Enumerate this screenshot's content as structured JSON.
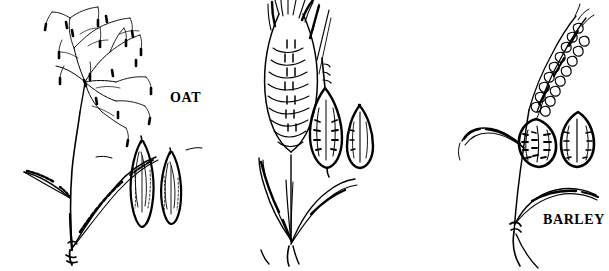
{
  "figure": {
    "width": 609,
    "height": 271,
    "background_color": "#ffffff",
    "ink_color": "#000000",
    "style": "pen-and-ink line engraving"
  },
  "panels": [
    {
      "id": "oat",
      "label": "OAT",
      "label_position": {
        "x": 170,
        "y": 91
      },
      "inflorescence_type": "open branched panicle with drooping spikelets",
      "seed_count": 2,
      "seed_shape": "long narrow lance-shaped grain with pointed tips",
      "leaf_count": 2
    },
    {
      "id": "barley",
      "label": "BARLEY",
      "label_position": {
        "x": 340,
        "y": 213
      },
      "inflorescence_type": "dense bearded spike with very long straight awns",
      "seed_count": 2,
      "seed_shape": "plump spindle-shaped grain, one with a drawn-out awn tip",
      "leaf_count": 2
    },
    {
      "id": "wheat",
      "label": "WHEAT",
      "label_position": {
        "x": 441,
        "y": 88
      },
      "inflorescence_type": "slender curved beaded spike without long awns",
      "seed_count": 2,
      "seed_shape": "short plump oval grain with a central crease",
      "leaf_count": 2
    }
  ]
}
